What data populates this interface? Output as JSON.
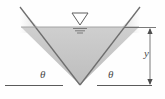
{
  "figure": {
    "name": "triangular-channel-cross-section",
    "type": "engineering-diagram"
  },
  "labels": {
    "theta_left": "θ",
    "theta_right": "θ",
    "depth": "y"
  },
  "icons": {
    "water_table": "water-table-triangle-icon",
    "arrow_up": "arrow-up-icon",
    "arrow_down": "arrow-down-icon"
  },
  "colors": {
    "water_fill": "#c4c4c4",
    "wall_line": "#6e6e6e",
    "ground_line": "#5a5a5a",
    "dimension_line": "#6b6b6b",
    "label_text": "#4a4a4a",
    "background": "#fefefe"
  },
  "geometry": {
    "vertex": [
      80,
      85
    ],
    "left_top": [
      20,
      7
    ],
    "right_top": [
      140,
      7
    ],
    "water_surface_y": 27,
    "ground_line_y": 85,
    "dimension_top_y": 28,
    "dimension_bottom_y": 85
  }
}
